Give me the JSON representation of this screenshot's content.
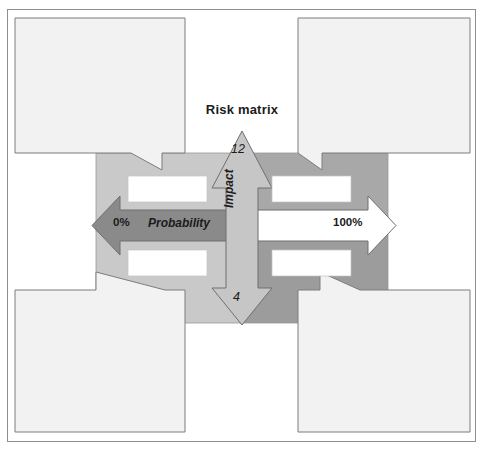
{
  "figure": {
    "title": "Risk matrix",
    "type": "risk-matrix-diagram"
  },
  "axes": {
    "horizontal": {
      "name": "Probability",
      "min_label": "0%",
      "max_label": "100%"
    },
    "vertical": {
      "name": "Impact",
      "max_label": "12",
      "min_label": "4"
    }
  },
  "quadrants": [
    {
      "id": "top-left",
      "fill": "#c9c9c9",
      "label": ""
    },
    {
      "id": "top-right",
      "fill": "#a8a8a8",
      "label": ""
    },
    {
      "id": "bottom-left",
      "fill": "#c9c9c9",
      "label": ""
    },
    {
      "id": "bottom-right",
      "fill": "#9c9c9c",
      "label": ""
    }
  ],
  "callouts": [
    {
      "id": "top-left",
      "text": ""
    },
    {
      "id": "top-right",
      "text": ""
    },
    {
      "id": "bottom-left",
      "text": ""
    },
    {
      "id": "bottom-right",
      "text": ""
    }
  ],
  "colors": {
    "frame_border": "#8e8e8e",
    "callout_fill": "#f2f2f2",
    "callout_border": "#7d7d7d",
    "arrow_dark": "#8a8a8a",
    "arrow_light": "#c6c6c6",
    "arrow_white": "#ffffff",
    "label_box": "#ffffff",
    "text": "#1b1b1b"
  }
}
